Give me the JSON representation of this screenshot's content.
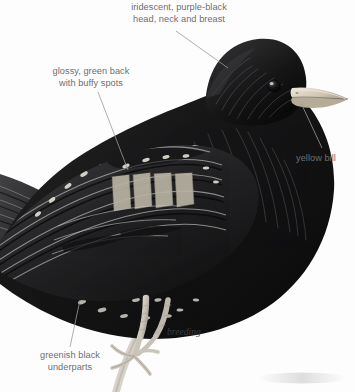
{
  "plate": {
    "subject": "european-starling-breeding-plumage",
    "background_color": "#fdfdfd",
    "ink_color": "#1a1a1a",
    "label_color": "#6e6e72",
    "leader_color": "#9a9a9e",
    "bill_color": "#d9d2bd",
    "bill_shadow_color": "#a79f8a",
    "leg_color": "#cfc9c0",
    "spot_color": "#e8e4da"
  },
  "annotations": [
    {
      "id": "head-neck-breast",
      "text": "iridescent, purple-black\nhead, neck and breast",
      "align": "center"
    },
    {
      "id": "green-back",
      "text": "glossy, green back\nwith buffy spots",
      "align": "center"
    },
    {
      "id": "yellow-bill",
      "text": "yellow bill",
      "align": "left"
    },
    {
      "id": "underparts",
      "text": "greenish black\nunderparts",
      "align": "center"
    }
  ],
  "plumage_caption": {
    "text": "breeding"
  },
  "leaders": [
    {
      "id": "leader-head-neck-breast",
      "from": [
        176,
        31
      ],
      "to": [
        228,
        68
      ]
    },
    {
      "id": "leader-green-back",
      "from": [
        98,
        92
      ],
      "to": [
        128,
        170
      ]
    },
    {
      "id": "leader-yellow-bill",
      "from": [
        322,
        148
      ],
      "to": [
        301,
        103
      ]
    },
    {
      "id": "leader-underparts",
      "from": [
        70,
        347
      ],
      "to": [
        80,
        300
      ]
    }
  ]
}
